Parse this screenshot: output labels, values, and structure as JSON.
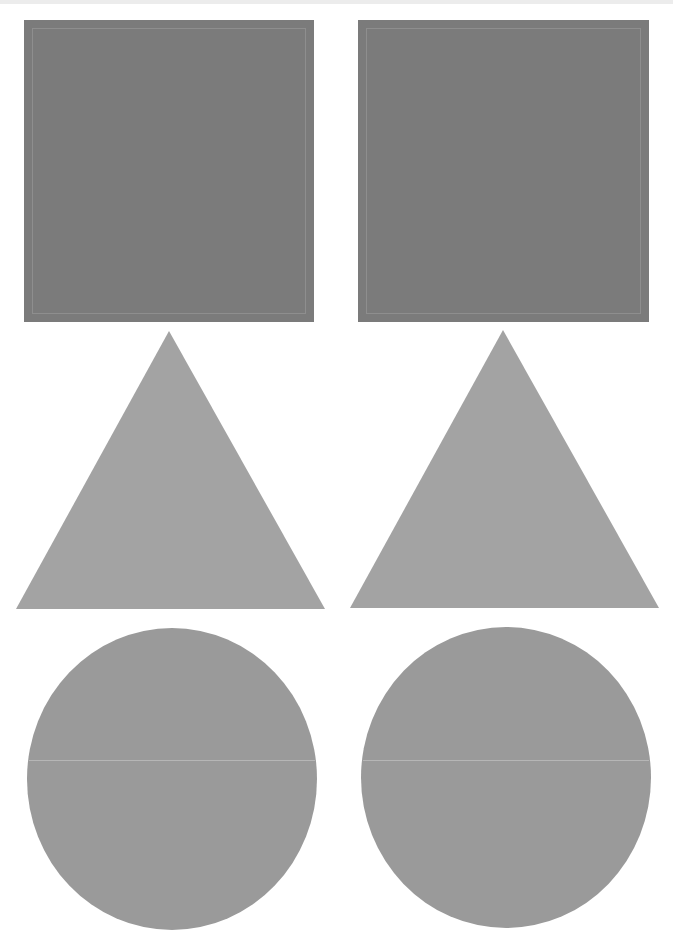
{
  "page": {
    "background": "#ffffff",
    "top_band_color": "#ececec"
  },
  "colors": {
    "square": "#7b7b7b",
    "triangle": "#a3a3a3",
    "circle": "#9a9a9a",
    "fold_line": "#cdcdcd"
  },
  "shapes": [
    {
      "type": "square",
      "column": "left",
      "label": "Square",
      "x": 24,
      "y": 20,
      "width": 290,
      "height": 302
    },
    {
      "type": "square",
      "column": "right",
      "label": "Square",
      "x": 358,
      "y": 20,
      "width": 291,
      "height": 302
    },
    {
      "type": "triangle",
      "column": "left",
      "label": "Triangle",
      "apex": [
        169,
        331
      ],
      "base_left": [
        16,
        609
      ],
      "base_right": [
        325,
        609
      ]
    },
    {
      "type": "triangle",
      "column": "right",
      "label": "Triangle",
      "apex": [
        503,
        330
      ],
      "base_left": [
        350,
        608
      ],
      "base_right": [
        659,
        608
      ]
    },
    {
      "type": "circle",
      "column": "left",
      "label": "Circle",
      "x": 27,
      "y": 628,
      "width": 290,
      "height": 302,
      "fold_line_y": 760
    },
    {
      "type": "circle",
      "column": "right",
      "label": "Circle",
      "x": 361,
      "y": 627,
      "width": 290,
      "height": 301,
      "fold_line_y": 760
    }
  ]
}
